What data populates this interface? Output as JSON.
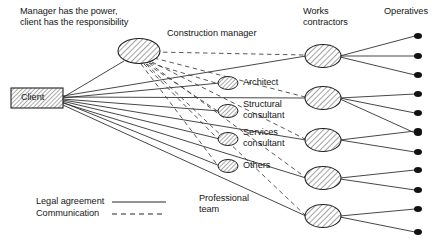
{
  "diagram": {
    "title_note": "Manager has the power,\nclient has the responsibility",
    "column_headers": {
      "works_contractors": "Works\ncontractors",
      "operatives": "Operatives"
    },
    "nodes": {
      "client": "Client",
      "construction_manager": "Construction manager",
      "professional_team_caption": "Professional\nteam",
      "professional_team": [
        "Architect",
        "Structural\nconsultant",
        "Services\nconsultant",
        "Others"
      ],
      "works_contractor_count": 5,
      "operative_count": 12
    },
    "legend": [
      {
        "label": "Legal agreement",
        "style": "solid"
      },
      {
        "label": "Communication",
        "style": "dashed"
      }
    ],
    "colors": {
      "line": "#262626",
      "fill_hatch": "#d9d9d9",
      "text": "#161616",
      "dot": "#111111"
    }
  }
}
